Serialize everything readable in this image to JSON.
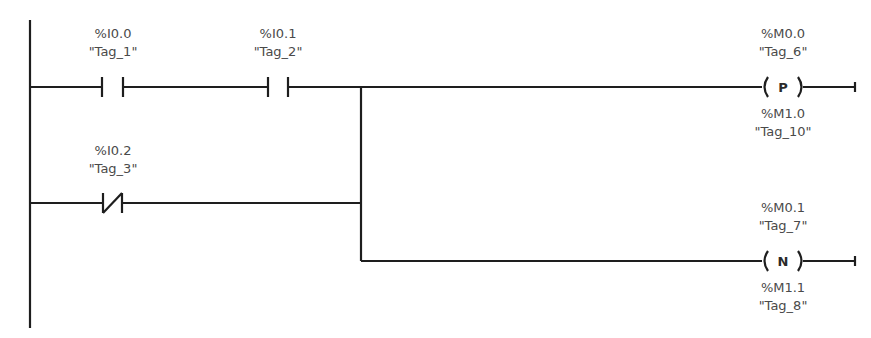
{
  "diagram": {
    "type": "ladder-logic",
    "contacts": [
      {
        "address": "%I0.0",
        "tag": "\"Tag_1\"",
        "kind": "normally-open"
      },
      {
        "address": "%I0.1",
        "tag": "\"Tag_2\"",
        "kind": "normally-open"
      },
      {
        "address": "%I0.2",
        "tag": "\"Tag_3\"",
        "kind": "normally-closed"
      }
    ],
    "coils": [
      {
        "address": "%M0.0",
        "tag": "\"Tag_6\"",
        "letter": "P",
        "edge_address": "%M1.0",
        "edge_tag": "\"Tag_10\"",
        "kind": "positive-edge"
      },
      {
        "address": "%M0.1",
        "tag": "\"Tag_7\"",
        "letter": "N",
        "edge_address": "%M1.1",
        "edge_tag": "\"Tag_8\"",
        "kind": "negative-edge"
      }
    ]
  }
}
